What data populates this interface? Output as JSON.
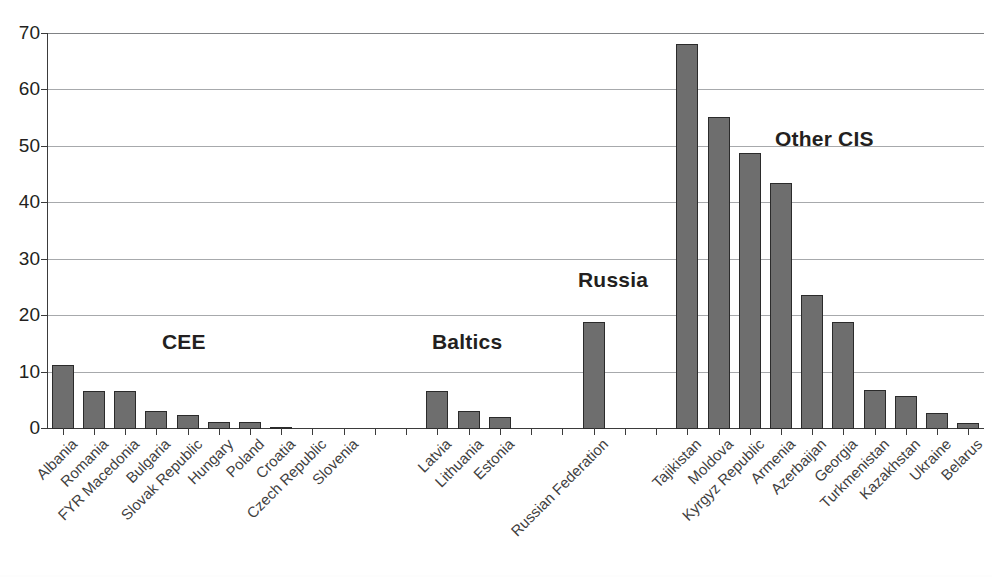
{
  "chart_data": {
    "type": "bar",
    "title": "",
    "xlabel": "",
    "ylabel": "",
    "ylim": [
      0,
      70
    ],
    "yticks": [
      0,
      10,
      20,
      30,
      40,
      50,
      60,
      70
    ],
    "grid": true,
    "legend": "none",
    "bar_color": "#6e6e6e",
    "bar_border_color": "#2b2b2b",
    "categories": [
      "Albania",
      "Romania",
      "FYR Macedonia",
      "Bulgaria",
      "Slovak Republic",
      "Hungary",
      "Poland",
      "Croatia",
      "Czech Republic",
      "Slovenia",
      "",
      "",
      "Latvia",
      "Lithuania",
      "Estonia",
      "",
      "",
      "Russian Federation",
      "",
      "",
      "Tajikistan",
      "Moldova",
      "Kyrgyz Republic",
      "Armenia",
      "Azerbaijan",
      "Georgia",
      "Turkmenistan",
      "Kazakhstan",
      "Ukraine",
      "Belarus"
    ],
    "values": [
      11.4,
      6.7,
      6.7,
      3.2,
      2.5,
      1.2,
      1.2,
      0.3,
      0.0,
      0.0,
      null,
      null,
      6.7,
      3.2,
      2.2,
      null,
      null,
      18.9,
      null,
      null,
      68.3,
      55.3,
      49.0,
      43.6,
      23.7,
      18.9,
      7.0,
      5.8,
      2.8,
      1.0
    ],
    "annotations": [
      {
        "text": "CEE",
        "at_category": "Slovak Republic",
        "value": 15
      },
      {
        "text": "Baltics",
        "at_category": "Latvia",
        "value": 15
      },
      {
        "text": "Russia",
        "at_category": "Russian Federation",
        "value": 26
      },
      {
        "text": "Other CIS",
        "at_category": "Armenia",
        "value": 51
      }
    ]
  },
  "axis": {
    "y_tick_labels": [
      "70",
      "60",
      "50",
      "40",
      "30",
      "20",
      "10",
      "0"
    ]
  },
  "groups": {
    "cee": "CEE",
    "baltics": "Baltics",
    "russia": "Russia",
    "other_cis": "Other CIS"
  }
}
